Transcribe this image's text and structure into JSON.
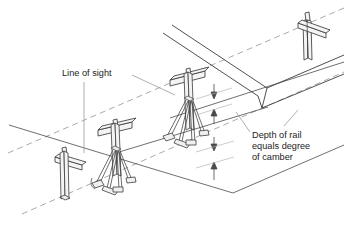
{
  "figure": {
    "type": "technical-line-drawing",
    "background_color": "#ffffff",
    "line_color": "#3c3c3c",
    "dashed_line_color": "#8c8c8c",
    "leader_color": "#9a9a9a",
    "text_color": "#1c1c1c",
    "shade_color": "#e8e8e8"
  },
  "annotations": {
    "line_of_sight": {
      "label": "Line of sight",
      "lines": [
        "Line of sight"
      ],
      "x": 62,
      "y": 76
    },
    "depth_of_rail": {
      "label": "Depth of rail equals degree of camber",
      "lines": [
        "Depth of rail",
        "equals degree",
        "of camber"
      ],
      "x": 252,
      "y": 135
    }
  },
  "components": {
    "stands": [
      {
        "name": "near-left-short-stand",
        "kind": "post-with-crossbar",
        "has_splayed_base": false
      },
      {
        "name": "center-left-trestle-stand",
        "kind": "post-with-crossbar-and-splayed-legs",
        "has_splayed_base": true
      },
      {
        "name": "center-tall-trestle-stand",
        "kind": "post-with-crossbar-and-splayed-legs",
        "has_splayed_base": true
      },
      {
        "name": "far-right-short-stand",
        "kind": "post-with-crossbar",
        "has_splayed_base": false
      }
    ],
    "rail": {
      "name": "cambered-rail-beam",
      "description": "long rail beam with visible cut end face"
    },
    "dimension_stacks": [
      {
        "name": "upper-camber-dimension",
        "arrow_top": "down",
        "arrow_bottom": "up"
      },
      {
        "name": "lower-camber-dimension",
        "arrow_top": "down",
        "arrow_bottom": "up"
      }
    ],
    "sight_lines": [
      {
        "name": "upper-sight-line",
        "style": "dashed"
      },
      {
        "name": "lower-sight-line",
        "style": "dashed"
      }
    ]
  }
}
